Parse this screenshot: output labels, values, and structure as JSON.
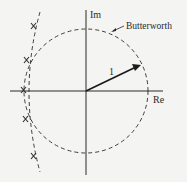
{
  "diagram": {
    "type": "s-plane pole plot",
    "axes": {
      "imag_label": "Im",
      "real_label": "Re"
    },
    "circle": {
      "label": "Butterworth",
      "radius_label": "1",
      "style": "dashed"
    },
    "poles": {
      "marker": "x",
      "count": 5,
      "curve_style": "dashed"
    },
    "colors": {
      "ink": "#2a2a2a",
      "background": "#f4f4f2"
    }
  }
}
